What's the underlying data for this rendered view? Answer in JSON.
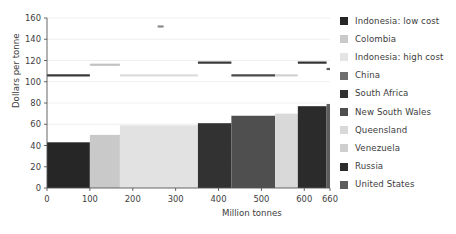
{
  "chart_data": {
    "type": "bar",
    "title": "",
    "xlabel": "Million tonnes",
    "ylabel": "Dollars per tonne",
    "xlim": [
      0,
      660
    ],
    "ylim": [
      0,
      160
    ],
    "ytick_values": [
      0,
      20,
      40,
      60,
      80,
      100,
      120,
      140,
      160
    ],
    "xtick_values": [
      0,
      100,
      200,
      300,
      400,
      500,
      600,
      660
    ],
    "grid": "horizontal",
    "legend_position": "right",
    "categories": [
      "Indonesia: low cost",
      "Colombia",
      "Indonesia: high cost",
      "China",
      "South Africa",
      "New South Wales",
      "Queensland",
      "Venezuela",
      "Russia",
      "United States"
    ],
    "colors": [
      "#262626",
      "#c9c9c9",
      "#e2e2e2",
      "#6e6e6e",
      "#323232",
      "#4f4f4f",
      "#d9d9d9",
      "#cfcfcf",
      "#2b2b2b",
      "#5c5c5c"
    ],
    "bars": [
      {
        "name": "Indonesia: low cost",
        "x_start": 0,
        "x_end": 100,
        "width": 100,
        "value": 43,
        "color": "#262626"
      },
      {
        "name": "Colombia",
        "x_start": 100,
        "x_end": 170,
        "width": 70,
        "value": 50,
        "color": "#c9c9c9"
      },
      {
        "name": "Indonesia: high cost",
        "x_start": 170,
        "x_end": 352,
        "width": 182,
        "value": 59,
        "color": "#e2e2e2"
      },
      {
        "name": "South Africa",
        "x_start": 352,
        "x_end": 430,
        "width": 78,
        "value": 61,
        "color": "#323232"
      },
      {
        "name": "New South Wales",
        "x_start": 430,
        "x_end": 532,
        "width": 102,
        "value": 68,
        "color": "#4f4f4f"
      },
      {
        "name": "Queensland",
        "x_start": 532,
        "x_end": 585,
        "width": 53,
        "value": 70,
        "color": "#d9d9d9"
      },
      {
        "name": "Russia",
        "x_start": 585,
        "x_end": 652,
        "width": 67,
        "value": 77,
        "color": "#2b2b2b"
      },
      {
        "name": "United States",
        "x_start": 652,
        "x_end": 660,
        "width": 8,
        "value": 79,
        "color": "#5c5c5c"
      }
    ],
    "price_lines": [
      {
        "name": "Indonesia: low cost",
        "x_start": 0,
        "x_end": 100,
        "value": 106,
        "color": "#3a3a3a"
      },
      {
        "name": "Colombia",
        "x_start": 100,
        "x_end": 170,
        "value": 116,
        "color": "#c2c2c2"
      },
      {
        "name": "Indonesia: high cost",
        "x_start": 170,
        "x_end": 352,
        "value": 106,
        "color": "#dcdcdc"
      },
      {
        "name": "China",
        "x_start": 258,
        "x_end": 272,
        "value": 152,
        "color": "#8a8a8a"
      },
      {
        "name": "South Africa",
        "x_start": 352,
        "x_end": 430,
        "value": 118,
        "color": "#3a3a3a"
      },
      {
        "name": "New South Wales",
        "x_start": 430,
        "x_end": 532,
        "value": 106,
        "color": "#4a4a4a"
      },
      {
        "name": "Queensland",
        "x_start": 532,
        "x_end": 585,
        "value": 106,
        "color": "#d2d2d2"
      },
      {
        "name": "Russia",
        "x_start": 585,
        "x_end": 652,
        "value": 118,
        "color": "#303030"
      },
      {
        "name": "United States",
        "x_start": 652,
        "x_end": 660,
        "value": 112,
        "color": "#5c5c5c"
      }
    ]
  },
  "legend": {
    "items": [
      {
        "label": "Indonesia: low cost",
        "color": "#262626"
      },
      {
        "label": "Colombia",
        "color": "#c9c9c9"
      },
      {
        "label": "Indonesia: high cost",
        "color": "#e4e4e4"
      },
      {
        "label": "China",
        "color": "#6e6e6e"
      },
      {
        "label": "South Africa",
        "color": "#323232"
      },
      {
        "label": "New South Wales",
        "color": "#4f4f4f"
      },
      {
        "label": "Queensland",
        "color": "#d9d9d9"
      },
      {
        "label": "Venezuela",
        "color": "#cfcfcf"
      },
      {
        "label": "Russia",
        "color": "#2b2b2b"
      },
      {
        "label": "United States",
        "color": "#5c5c5c"
      }
    ]
  },
  "axes": {
    "y_title": "Dollars per tonne",
    "x_title": "Million tonnes",
    "y_ticks": [
      "0",
      "20",
      "40",
      "60",
      "80",
      "100",
      "120",
      "140",
      "160"
    ],
    "x_ticks": [
      "0",
      "100",
      "200",
      "300",
      "400",
      "500",
      "600",
      "660"
    ]
  }
}
